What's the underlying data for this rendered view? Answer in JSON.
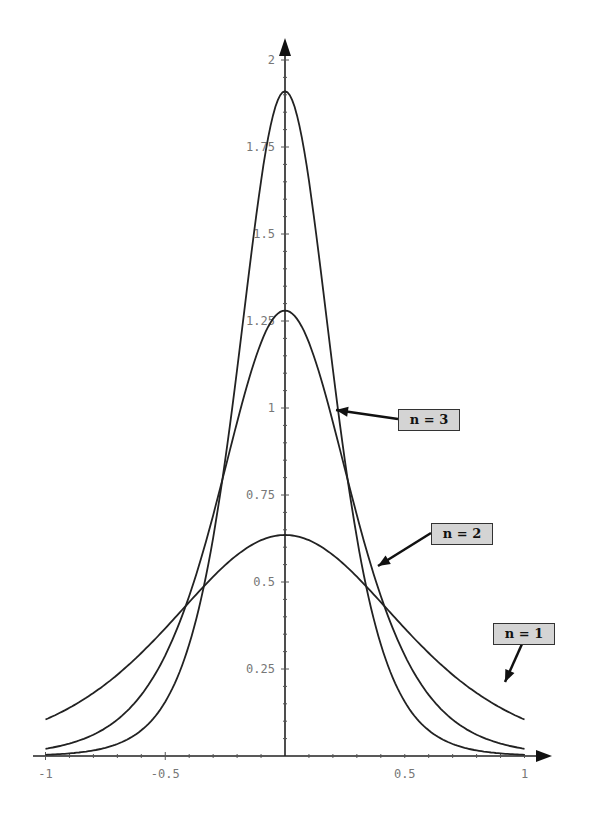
{
  "chart_data": {
    "type": "line",
    "title": "",
    "xlabel": "",
    "ylabel": "",
    "xlim": [
      -1,
      1
    ],
    "ylim": [
      0,
      2
    ],
    "grid": false,
    "x_ticks": [
      -1,
      -0.5,
      0.5,
      1
    ],
    "x_tick_labels": [
      "-1",
      "-0.5",
      "0.5",
      "1"
    ],
    "y_ticks": [
      0.25,
      0.5,
      0.75,
      1,
      1.25,
      1.5,
      1.75,
      2
    ],
    "y_tick_labels": [
      "0.25",
      "0.5",
      "0.75",
      "1",
      "1.25",
      "1.5",
      "1.75",
      "2"
    ],
    "x": [
      -1,
      -0.9,
      -0.8,
      -0.7,
      -0.6,
      -0.5,
      -0.4,
      -0.3,
      -0.2,
      -0.1,
      0,
      0.1,
      0.2,
      0.3,
      0.4,
      0.5,
      0.6,
      0.7,
      0.8,
      0.9,
      1
    ],
    "series": [
      {
        "name": "n = 1",
        "peak": 0.635,
        "values": [
          0.16,
          0.19,
          0.23,
          0.27,
          0.32,
          0.38,
          0.44,
          0.51,
          0.57,
          0.62,
          0.635,
          0.62,
          0.57,
          0.51,
          0.44,
          0.38,
          0.32,
          0.27,
          0.23,
          0.19,
          0.16
        ]
      },
      {
        "name": "n = 2",
        "peak": 1.28,
        "values": [
          0.055,
          0.07,
          0.1,
          0.14,
          0.2,
          0.29,
          0.44,
          0.65,
          0.92,
          1.18,
          1.28,
          1.18,
          0.92,
          0.65,
          0.44,
          0.29,
          0.2,
          0.14,
          0.1,
          0.07,
          0.055
        ]
      },
      {
        "name": "n = 3",
        "peak": 1.91,
        "values": [
          0.025,
          0.035,
          0.05,
          0.08,
          0.12,
          0.2,
          0.34,
          0.6,
          1.05,
          1.62,
          1.91,
          1.62,
          1.05,
          0.6,
          0.34,
          0.2,
          0.12,
          0.08,
          0.05,
          0.035,
          0.025
        ]
      }
    ],
    "annotations": [
      {
        "text": "n = 3",
        "arrow_to": "n = 3 curve"
      },
      {
        "text": "n = 2",
        "arrow_to": "n = 2 curve"
      },
      {
        "text": "n = 1",
        "arrow_to": "n = 1 curve"
      }
    ]
  },
  "legend": {
    "n3": "n = 3",
    "n2": "n = 2",
    "n1": "n = 1"
  },
  "colors": {
    "curve": "#222222",
    "axis": "#222222",
    "label_box": "#d4d4d4"
  }
}
